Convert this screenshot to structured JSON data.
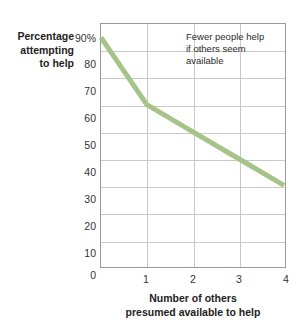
{
  "chart_data": {
    "type": "line",
    "title": "",
    "xlabel": "Number of others\npresumed available to help",
    "ylabel": "Percentage\nattempting\nto help",
    "x": [
      0,
      1,
      2,
      3,
      4
    ],
    "values": [
      85,
      60,
      50,
      40,
      30
    ],
    "series": [
      {
        "name": "Percentage attempting to help",
        "values": [
          85,
          60,
          50,
          40,
          30
        ],
        "color": "#a6c489"
      }
    ],
    "xlim": [
      0,
      4
    ],
    "ylim": [
      0,
      90
    ],
    "xticks": [
      "1",
      "2",
      "3",
      "4"
    ],
    "xtick_values": [
      1,
      2,
      3,
      4
    ],
    "yticks": [
      "0",
      "10",
      "20",
      "30",
      "40",
      "50",
      "60",
      "70",
      "80",
      "90%"
    ],
    "ytick_values": [
      0,
      10,
      20,
      30,
      40,
      50,
      60,
      70,
      80,
      90
    ],
    "grid": true,
    "legend": "none",
    "annotations": [
      {
        "text": "Fewer people help\nif others seem\navailable",
        "x": 2.1,
        "y": 85
      }
    ]
  },
  "colors": {
    "line": "#a6c489",
    "grid": "#c9c9c9",
    "frame": "#9a9a9a",
    "text": "#2b2b2b",
    "background": "#ffffff"
  }
}
